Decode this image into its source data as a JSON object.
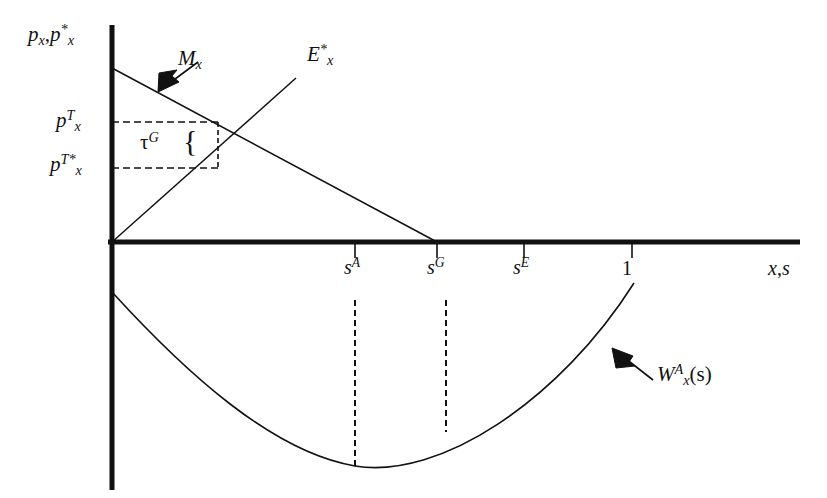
{
  "figure": {
    "kind": "economics-diagram",
    "background": "#ffffff",
    "ink": "#111111"
  },
  "axes": {
    "y_caption_html": "p_x , p*_x",
    "y_caption_parts": {
      "p1": "p",
      "sub1": "x",
      "sep": ",",
      "p2": "p",
      "sup2": "*",
      "sub2": "x"
    },
    "x_caption_parts": {
      "x": "x",
      "sep": ",",
      "s": "s"
    },
    "origin": {
      "x": 112,
      "y": 242
    },
    "x_axis_end": 800,
    "y_axis_top": 25,
    "y_axis_bottom": 490
  },
  "price_levels": [
    {
      "name": "p-x-T",
      "base": "p",
      "sub": "x",
      "sup": "T",
      "y": 122,
      "label_left": 56
    },
    {
      "name": "p-x-T-star",
      "base": "p",
      "sub": "x",
      "sup": "T*",
      "y": 168,
      "label_left": 50
    }
  ],
  "tax_wedge": {
    "symbol": "τ",
    "superscript": "G",
    "brace": "{",
    "box": {
      "left": 112,
      "top": 122,
      "right": 218,
      "bottom": 168
    }
  },
  "curves": [
    {
      "name": "import-demand-curve",
      "label_base": "M",
      "label_sub": "x",
      "label_sup": "",
      "from": {
        "x": 112,
        "y": 68
      },
      "to": {
        "x": 437,
        "y": 242
      },
      "arrow": {
        "tail_x": 198,
        "tail_y": 62,
        "head_x": 162,
        "head_y": 88
      }
    },
    {
      "name": "export-supply-curve",
      "label_base": "E",
      "label_sub": "x",
      "label_sup": "*",
      "from": {
        "x": 112,
        "y": 242
      },
      "to": {
        "x": 296,
        "y": 78
      }
    },
    {
      "name": "welfare-curve",
      "label_base": "W",
      "label_sub": "x",
      "label_sup": "A",
      "label_arg": "(s)",
      "from": {
        "x": 112,
        "y": 292
      },
      "minimum": {
        "x": 355,
        "y": 466
      },
      "to": {
        "x": 634,
        "y": 283
      },
      "arrow": {
        "tail_x": 650,
        "tail_y": 378,
        "head_x": 614,
        "head_y": 350
      }
    }
  ],
  "x_ticks": [
    {
      "name": "tick-s-A",
      "x": 355,
      "base": "s",
      "sup": "A",
      "label_left": 344,
      "dashed_to_y": 466
    },
    {
      "name": "tick-s-G",
      "x": 437,
      "base": "s",
      "sup": "G",
      "label_left": 427,
      "dashed_to_y": 432
    },
    {
      "name": "tick-s-E",
      "x": 524,
      "base": "s",
      "sup": "E",
      "label_left": 513,
      "dashed_to_y": null
    },
    {
      "name": "tick-one",
      "x": 632,
      "base": "1",
      "sup": "",
      "label_left": 622,
      "dashed_to_y": null
    }
  ]
}
